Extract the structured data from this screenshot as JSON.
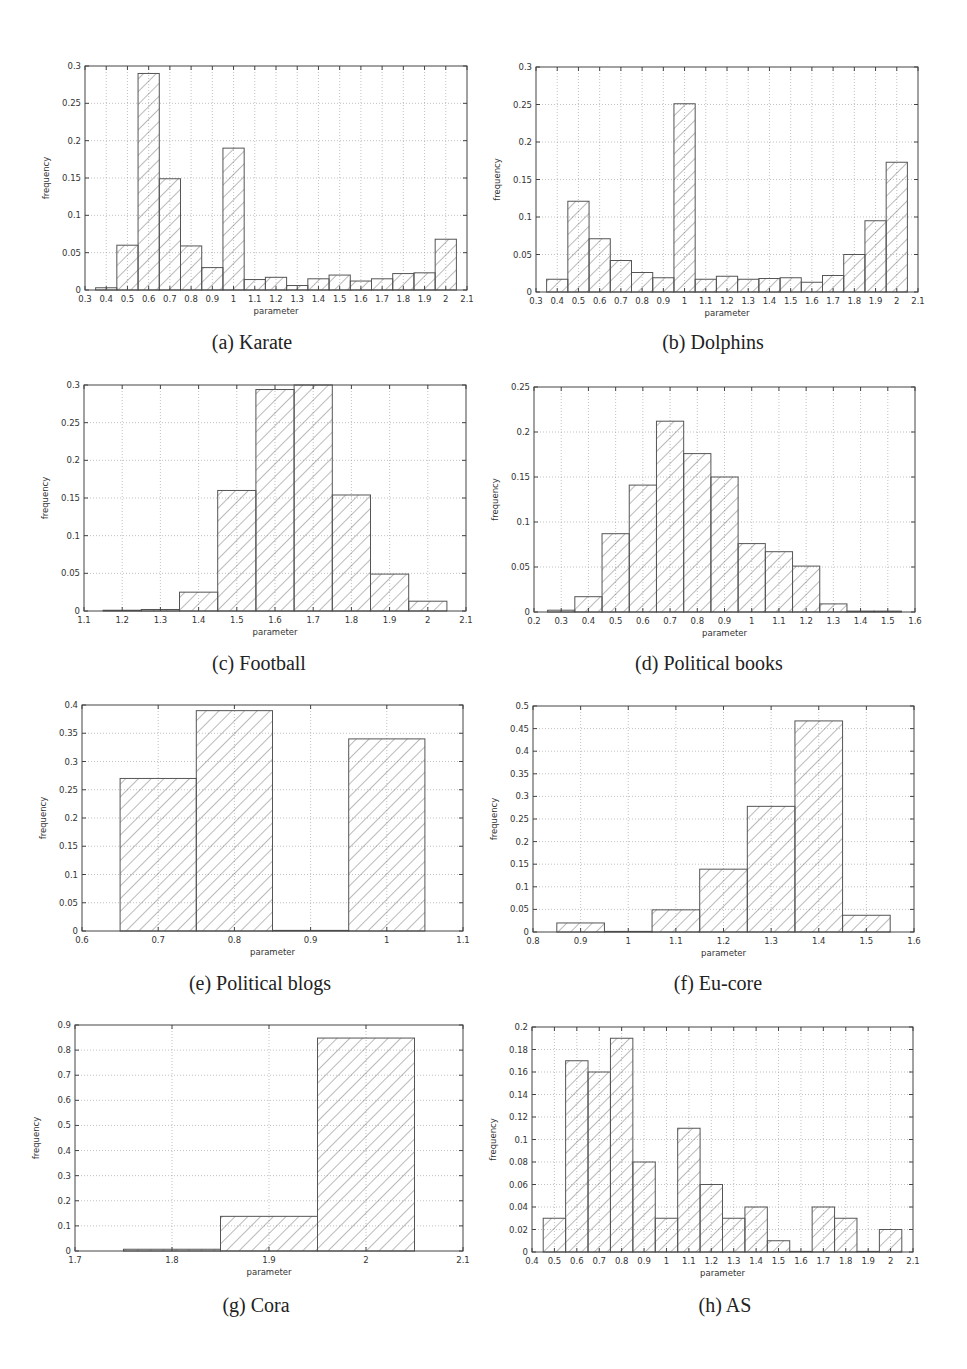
{
  "figure": {
    "captions": [
      "(a) Karate",
      "(b) Dolphins",
      "(c) Football",
      "(d) Political books",
      "(e) Political blogs",
      "(f) Eu-core",
      "(g) Cora",
      "(h) AS"
    ]
  },
  "colors": {
    "frame": "#444444",
    "bar_edge": "#555555",
    "hatch": "#666666",
    "grid": "#999999",
    "text": "#333333"
  },
  "chart_data": [
    {
      "id": "karate",
      "type": "bar",
      "title": "(a) Karate",
      "xlabel": "parameter",
      "ylabel": "frequency",
      "xlim": [
        0.3,
        2.1
      ],
      "ylim": [
        0,
        0.3
      ],
      "grid": true,
      "bin_width": 0.1,
      "hatch": true,
      "xticks": [
        "0.3",
        "0.4",
        "0.5",
        "0.6",
        "0.7",
        "0.8",
        "0.9",
        "1",
        "1.1",
        "1.2",
        "1.3",
        "1.4",
        "1.5",
        "1.6",
        "1.7",
        "1.8",
        "1.9",
        "2",
        "2.1"
      ],
      "yticks": [
        "0",
        "0.05",
        "0.1",
        "0.15",
        "0.2",
        "0.25",
        "0.3"
      ],
      "categories": [
        0.4,
        0.5,
        0.6,
        0.7,
        0.8,
        0.9,
        1.0,
        1.1,
        1.2,
        1.3,
        1.4,
        1.5,
        1.6,
        1.7,
        1.8,
        1.9,
        2.0
      ],
      "values": [
        0.003,
        0.06,
        0.29,
        0.149,
        0.059,
        0.03,
        0.19,
        0.014,
        0.017,
        0.006,
        0.015,
        0.02,
        0.012,
        0.015,
        0.022,
        0.023,
        0.068
      ]
    },
    {
      "id": "dolphins",
      "type": "bar",
      "title": "(b) Dolphins",
      "xlabel": "parameter",
      "ylabel": "frequency",
      "xlim": [
        0.3,
        2.1
      ],
      "ylim": [
        0,
        0.3
      ],
      "grid": true,
      "bin_width": 0.1,
      "hatch": true,
      "xticks": [
        "0.3",
        "0.4",
        "0.5",
        "0.6",
        "0.7",
        "0.8",
        "0.9",
        "1",
        "1.1",
        "1.2",
        "1.3",
        "1.4",
        "1.5",
        "1.6",
        "1.7",
        "1.8",
        "1.9",
        "2",
        "2.1"
      ],
      "yticks": [
        "0",
        "0.05",
        "0.1",
        "0.15",
        "0.2",
        "0.25",
        "0.3"
      ],
      "categories": [
        0.4,
        0.5,
        0.6,
        0.7,
        0.8,
        0.9,
        1.0,
        1.1,
        1.2,
        1.3,
        1.4,
        1.5,
        1.6,
        1.7,
        1.8,
        1.9,
        2.0
      ],
      "values": [
        0.017,
        0.121,
        0.071,
        0.042,
        0.026,
        0.019,
        0.251,
        0.017,
        0.021,
        0.017,
        0.018,
        0.019,
        0.013,
        0.022,
        0.05,
        0.095,
        0.173
      ]
    },
    {
      "id": "football",
      "type": "bar",
      "title": "(c) Football",
      "xlabel": "parameter",
      "ylabel": "frequency",
      "xlim": [
        1.1,
        2.1
      ],
      "ylim": [
        0,
        0.3
      ],
      "grid": true,
      "bin_width": 0.1,
      "hatch": true,
      "xticks": [
        "1.1",
        "1.2",
        "1.3",
        "1.4",
        "1.5",
        "1.6",
        "1.7",
        "1.8",
        "1.9",
        "2",
        "2.1"
      ],
      "yticks": [
        "0",
        "0.05",
        "0.1",
        "0.15",
        "0.2",
        "0.25",
        "0.3"
      ],
      "categories": [
        1.2,
        1.3,
        1.4,
        1.5,
        1.6,
        1.7,
        1.8,
        1.9,
        2.0
      ],
      "values": [
        0.001,
        0.002,
        0.025,
        0.16,
        0.294,
        0.3,
        0.154,
        0.049,
        0.013
      ]
    },
    {
      "id": "political_books",
      "type": "bar",
      "title": "(d) Political books",
      "xlabel": "parameter",
      "ylabel": "frequency",
      "xlim": [
        0.2,
        1.6
      ],
      "ylim": [
        0,
        0.25
      ],
      "grid": true,
      "bin_width": 0.1,
      "hatch": true,
      "xticks": [
        "0.2",
        "0.3",
        "0.4",
        "0.5",
        "0.6",
        "0.7",
        "0.8",
        "0.9",
        "1",
        "1.1",
        "1.2",
        "1.3",
        "1.4",
        "1.5",
        "1.6"
      ],
      "yticks": [
        "0",
        "0.05",
        "0.1",
        "0.15",
        "0.2",
        "0.25"
      ],
      "categories": [
        0.3,
        0.4,
        0.5,
        0.6,
        0.7,
        0.8,
        0.9,
        1.0,
        1.1,
        1.2,
        1.3,
        1.4,
        1.5
      ],
      "values": [
        0.002,
        0.017,
        0.087,
        0.141,
        0.212,
        0.176,
        0.15,
        0.076,
        0.067,
        0.051,
        0.009,
        0.001,
        0.001
      ]
    },
    {
      "id": "political_blogs",
      "type": "bar",
      "title": "(e) Political blogs",
      "xlabel": "parameter",
      "ylabel": "frequency",
      "xlim": [
        0.6,
        1.1
      ],
      "ylim": [
        0,
        0.4
      ],
      "grid": true,
      "bin_width": 0.1,
      "hatch": true,
      "xticks": [
        "0.6",
        "0.7",
        "0.8",
        "0.9",
        "1",
        "1.1"
      ],
      "yticks": [
        "0",
        "0.05",
        "0.1",
        "0.15",
        "0.2",
        "0.25",
        "0.3",
        "0.35",
        "0.4"
      ],
      "categories": [
        0.7,
        0.8,
        0.9,
        1.0
      ],
      "values": [
        0.27,
        0.39,
        0.0,
        0.34
      ]
    },
    {
      "id": "eu_core",
      "type": "bar",
      "title": "(f) Eu-core",
      "xlabel": "parameter",
      "ylabel": "frequency",
      "xlim": [
        0.8,
        1.6
      ],
      "ylim": [
        0,
        0.5
      ],
      "grid": true,
      "bin_width": 0.1,
      "hatch": true,
      "xticks": [
        "0.8",
        "0.9",
        "1",
        "1.1",
        "1.2",
        "1.3",
        "1.4",
        "1.5",
        "1.6"
      ],
      "yticks": [
        "0",
        "0.05",
        "0.1",
        "0.15",
        "0.2",
        "0.25",
        "0.3",
        "0.35",
        "0.4",
        "0.45",
        "0.5"
      ],
      "categories": [
        0.9,
        1.0,
        1.1,
        1.2,
        1.3,
        1.4,
        1.5
      ],
      "values": [
        0.02,
        0.0,
        0.049,
        0.139,
        0.278,
        0.467,
        0.037
      ]
    },
    {
      "id": "cora",
      "type": "bar",
      "title": "(g) Cora",
      "xlabel": "parameter",
      "ylabel": "frequency",
      "xlim": [
        1.7,
        2.1
      ],
      "ylim": [
        0,
        0.9
      ],
      "grid": true,
      "bin_width": 0.1,
      "hatch": true,
      "xticks": [
        "1.7",
        "1.8",
        "1.9",
        "2",
        "2.1"
      ],
      "yticks": [
        "0",
        "0.1",
        "0.2",
        "0.3",
        "0.4",
        "0.5",
        "0.6",
        "0.7",
        "0.8",
        "0.9"
      ],
      "categories": [
        1.8,
        1.9,
        2.0
      ],
      "values": [
        0.007,
        0.138,
        0.848
      ]
    },
    {
      "id": "as",
      "type": "bar",
      "title": "(h) AS",
      "xlabel": "parameter",
      "ylabel": "frequency",
      "xlim": [
        0.4,
        2.1
      ],
      "ylim": [
        0,
        0.2
      ],
      "grid": true,
      "bin_width": 0.1,
      "hatch": true,
      "xticks": [
        "0.4",
        "0.5",
        "0.6",
        "0.7",
        "0.8",
        "0.9",
        "1",
        "1.1",
        "1.2",
        "1.3",
        "1.4",
        "1.5",
        "1.6",
        "1.7",
        "1.8",
        "1.9",
        "2",
        "2.1"
      ],
      "yticks": [
        "0",
        "0.02",
        "0.04",
        "0.06",
        "0.08",
        "0.1",
        "0.12",
        "0.14",
        "0.16",
        "0.18",
        "0.2"
      ],
      "categories": [
        0.5,
        0.6,
        0.7,
        0.8,
        0.9,
        1.0,
        1.1,
        1.2,
        1.3,
        1.4,
        1.5,
        1.6,
        1.7,
        1.8,
        1.9,
        2.0
      ],
      "values": [
        0.03,
        0.17,
        0.16,
        0.19,
        0.08,
        0.03,
        0.11,
        0.06,
        0.03,
        0.04,
        0.01,
        0.0,
        0.04,
        0.03,
        0.0,
        0.02
      ]
    }
  ],
  "layout_frames": [
    {
      "left": 85,
      "top": 66,
      "right": 467,
      "bottom": 290
    },
    {
      "left": 536,
      "top": 67,
      "right": 918,
      "bottom": 292
    },
    {
      "left": 84,
      "top": 385,
      "right": 466,
      "bottom": 611
    },
    {
      "left": 534,
      "top": 387,
      "right": 915,
      "bottom": 612
    },
    {
      "left": 82,
      "top": 705,
      "right": 463,
      "bottom": 931
    },
    {
      "left": 533,
      "top": 706,
      "right": 914,
      "bottom": 932
    },
    {
      "left": 75,
      "top": 1025,
      "right": 463,
      "bottom": 1251
    },
    {
      "left": 532,
      "top": 1027,
      "right": 913,
      "bottom": 1252
    }
  ],
  "caption_positions": [
    {
      "x": 252,
      "y": 343
    },
    {
      "x": 713,
      "y": 343
    },
    {
      "x": 259,
      "y": 664
    },
    {
      "x": 709,
      "y": 664
    },
    {
      "x": 260,
      "y": 984
    },
    {
      "x": 718,
      "y": 984
    },
    {
      "x": 256,
      "y": 1306
    },
    {
      "x": 725,
      "y": 1306
    }
  ]
}
